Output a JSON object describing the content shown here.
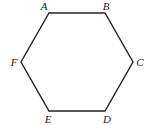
{
  "diagram": {
    "shape": "hexagon",
    "stroke_color": "#222222",
    "vertices": [
      {
        "label": "A",
        "x": 49,
        "y": 13
      },
      {
        "label": "B",
        "x": 105,
        "y": 13
      },
      {
        "label": "C",
        "x": 133,
        "y": 62
      },
      {
        "label": "D",
        "x": 105,
        "y": 111
      },
      {
        "label": "E",
        "x": 49,
        "y": 111
      },
      {
        "label": "F",
        "x": 21,
        "y": 62
      }
    ]
  }
}
